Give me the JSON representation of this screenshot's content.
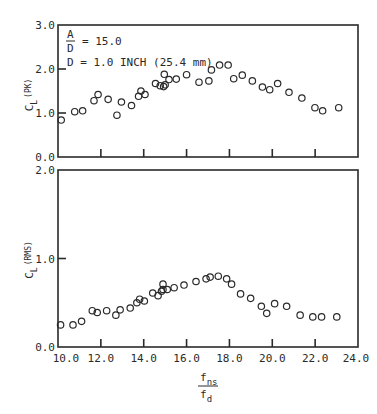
{
  "chart_data": [
    {
      "type": "scatter",
      "title": "",
      "annotation": {
        "ratio_numerator": "A",
        "ratio_denominator": "D",
        "ratio_value": "= 15.0",
        "diameter": "D = 1.0 INCH (25.4 mm)"
      },
      "xlabel": "f_ns / f_d",
      "ylabel": "C_L (PK)",
      "ylabel_main": "C",
      "ylabel_sub": "L",
      "ylabel_paren": "(PK)",
      "xlim": [
        10.0,
        24.0
      ],
      "ylim": [
        0.0,
        3.0
      ],
      "yticks": [
        "0.0",
        "1.0",
        "2.0",
        "3.0"
      ],
      "grid": false,
      "x": [
        10.15,
        10.78,
        11.15,
        11.68,
        11.87,
        12.34,
        12.75,
        12.96,
        13.43,
        13.76,
        13.87,
        14.06,
        14.55,
        14.77,
        14.93,
        15.0,
        14.96,
        15.18,
        15.52,
        16.0,
        16.58,
        17.04,
        17.16,
        17.54,
        17.94,
        18.2,
        18.6,
        19.07,
        19.54,
        19.88,
        20.25,
        20.78,
        21.38,
        21.99,
        22.35,
        23.1
      ],
      "y": [
        0.84,
        1.03,
        1.05,
        1.28,
        1.42,
        1.31,
        0.95,
        1.25,
        1.17,
        1.38,
        1.5,
        1.42,
        1.67,
        1.62,
        1.6,
        1.64,
        1.88,
        1.76,
        1.77,
        1.87,
        1.7,
        1.73,
        1.98,
        2.09,
        2.09,
        1.78,
        1.86,
        1.73,
        1.59,
        1.53,
        1.67,
        1.47,
        1.34,
        1.12,
        1.05,
        1.12
      ]
    },
    {
      "type": "scatter",
      "title": "",
      "xlabel": "f_ns / f_d",
      "ylabel": "C_L (RMS)",
      "ylabel_main": "C",
      "ylabel_sub": "L",
      "ylabel_paren": "(RMS)",
      "xlim": [
        10.0,
        24.0
      ],
      "ylim": [
        0.0,
        2.0
      ],
      "yticks": [
        "0.0",
        "1.0",
        "2.0"
      ],
      "xticks": [
        "10.0",
        "12.0",
        "14.0",
        "16.0",
        "18.0",
        "20.0",
        "22.0",
        "24.0"
      ],
      "grid": false,
      "x": [
        10.12,
        10.7,
        11.1,
        11.6,
        11.83,
        12.27,
        12.7,
        12.9,
        13.37,
        13.68,
        13.81,
        14.03,
        14.42,
        14.67,
        14.83,
        14.9,
        14.9,
        15.1,
        15.42,
        15.88,
        16.44,
        16.91,
        17.1,
        17.48,
        17.87,
        18.1,
        18.52,
        18.99,
        19.49,
        19.74,
        20.11,
        20.67,
        21.3,
        21.89,
        22.3,
        23.01
      ],
      "y": [
        0.25,
        0.25,
        0.29,
        0.41,
        0.39,
        0.41,
        0.36,
        0.42,
        0.44,
        0.5,
        0.54,
        0.52,
        0.61,
        0.58,
        0.63,
        0.71,
        0.65,
        0.65,
        0.67,
        0.7,
        0.74,
        0.77,
        0.79,
        0.8,
        0.77,
        0.71,
        0.6,
        0.55,
        0.46,
        0.38,
        0.49,
        0.46,
        0.36,
        0.34,
        0.34,
        0.34
      ]
    }
  ],
  "x_axis": {
    "ticks": [
      "10.0",
      "12.0",
      "14.0",
      "16.0",
      "18.0",
      "20.0",
      "22.0",
      "24.0"
    ],
    "label_numerator": "f",
    "label_numerator_sub": "ns",
    "label_denominator": "f",
    "label_denominator_sub": "d"
  }
}
